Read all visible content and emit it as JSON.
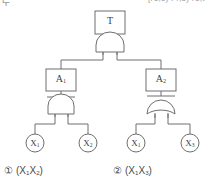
{
  "header": {
    "left_fragment": "도.",
    "right_fragment": "[r1,s) r4,s) r1,t"
  },
  "diagram": {
    "type": "fault-tree",
    "colors": {
      "stroke": "#6e6e6e",
      "fill": "#ffffff",
      "text": "#3d3d3d",
      "caption": "#4a4a4a",
      "header": "#9a9a9a"
    },
    "nodes": [
      {
        "id": "T",
        "kind": "event-box",
        "label": "T",
        "sub": "",
        "cx": 110,
        "cy": 23
      },
      {
        "id": "G0",
        "kind": "and-gate",
        "label": "",
        "sub": "",
        "cx": 110,
        "cy": 43
      },
      {
        "id": "A1",
        "kind": "event-box",
        "label": "A",
        "sub": "1",
        "cx": 61,
        "cy": 80
      },
      {
        "id": "A2",
        "kind": "event-box",
        "label": "A",
        "sub": "2",
        "cx": 161,
        "cy": 80
      },
      {
        "id": "G1",
        "kind": "and-gate",
        "label": "",
        "sub": "",
        "cx": 61,
        "cy": 104
      },
      {
        "id": "G2",
        "kind": "or-gate",
        "label": "",
        "sub": "",
        "cx": 161,
        "cy": 104
      },
      {
        "id": "X1a",
        "kind": "basic-event",
        "label": "X",
        "sub": "1",
        "cx": 35,
        "cy": 142
      },
      {
        "id": "X2",
        "kind": "basic-event",
        "label": "X",
        "sub": "2",
        "cx": 88,
        "cy": 142
      },
      {
        "id": "X1b",
        "kind": "basic-event",
        "label": "X",
        "sub": "1",
        "cx": 136,
        "cy": 142
      },
      {
        "id": "X3",
        "kind": "basic-event",
        "label": "X",
        "sub": "3",
        "cx": 190,
        "cy": 142
      }
    ],
    "edges": [
      {
        "from": "T",
        "to": "G0"
      },
      {
        "from": "G0",
        "to": "A1"
      },
      {
        "from": "G0",
        "to": "A2"
      },
      {
        "from": "A1",
        "to": "G1"
      },
      {
        "from": "A2",
        "to": "G2"
      },
      {
        "from": "G1",
        "to": "X1a"
      },
      {
        "from": "G1",
        "to": "X2"
      },
      {
        "from": "G2",
        "to": "X1b"
      },
      {
        "from": "G2",
        "to": "X3"
      }
    ]
  },
  "captions": [
    {
      "marker": "①",
      "open": "(",
      "t1": "X",
      "s1": "1",
      "t2": "X",
      "s2": "2",
      "close": ")"
    },
    {
      "marker": "②",
      "open": "(",
      "t1": "X",
      "s1": "1",
      "t2": "X",
      "s2": "3",
      "close": ")"
    }
  ]
}
